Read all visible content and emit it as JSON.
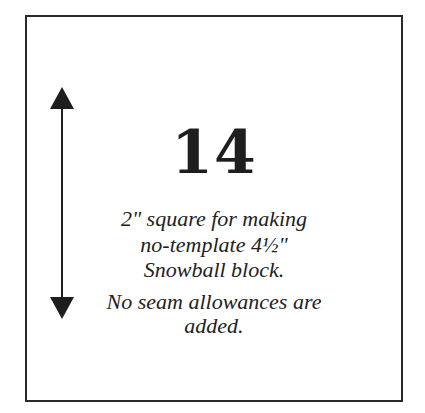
{
  "card": {
    "number": "14",
    "description_lines": [
      "2\" square for making",
      "no-template 4½\"",
      "Snowball block."
    ],
    "note_lines": [
      "No seam allowances are",
      "added."
    ],
    "grain_arrow": {
      "icon": "double-headed-vertical-arrow-icon",
      "color": "#1e1e1e"
    },
    "border_color": "#2a2a2a"
  }
}
